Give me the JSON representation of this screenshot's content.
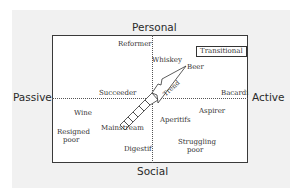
{
  "axes": {
    "top": "Personal",
    "bottom": "Social",
    "left": "Passive",
    "right": "Active"
  },
  "legend_box": "Transitional",
  "trend_label": "Trend",
  "labels": [
    {
      "id": "reformer",
      "text": "Reformer"
    },
    {
      "id": "whiskey",
      "text": "Whiskey"
    },
    {
      "id": "beer",
      "text": "Beer"
    },
    {
      "id": "succeeder",
      "text": "Succeeder"
    },
    {
      "id": "bacardi",
      "text": "Bacardi"
    },
    {
      "id": "wine",
      "text": "Wine"
    },
    {
      "id": "aspirer",
      "text": "Aspirer"
    },
    {
      "id": "aperitifs",
      "text": "Aperitifs"
    },
    {
      "id": "mainstream",
      "text": "Mainstream"
    },
    {
      "id": "resigned-poor-1",
      "text": "Resigned"
    },
    {
      "id": "resigned-poor-2",
      "text": "poor"
    },
    {
      "id": "digestif",
      "text": "Digestif"
    },
    {
      "id": "struggling-poor-1",
      "text": "Struggling"
    },
    {
      "id": "struggling-poor-2",
      "text": "poor"
    }
  ],
  "colors": {
    "panel": "#f1f1f1",
    "frame": "#3a3a3a",
    "text": "#333333"
  }
}
